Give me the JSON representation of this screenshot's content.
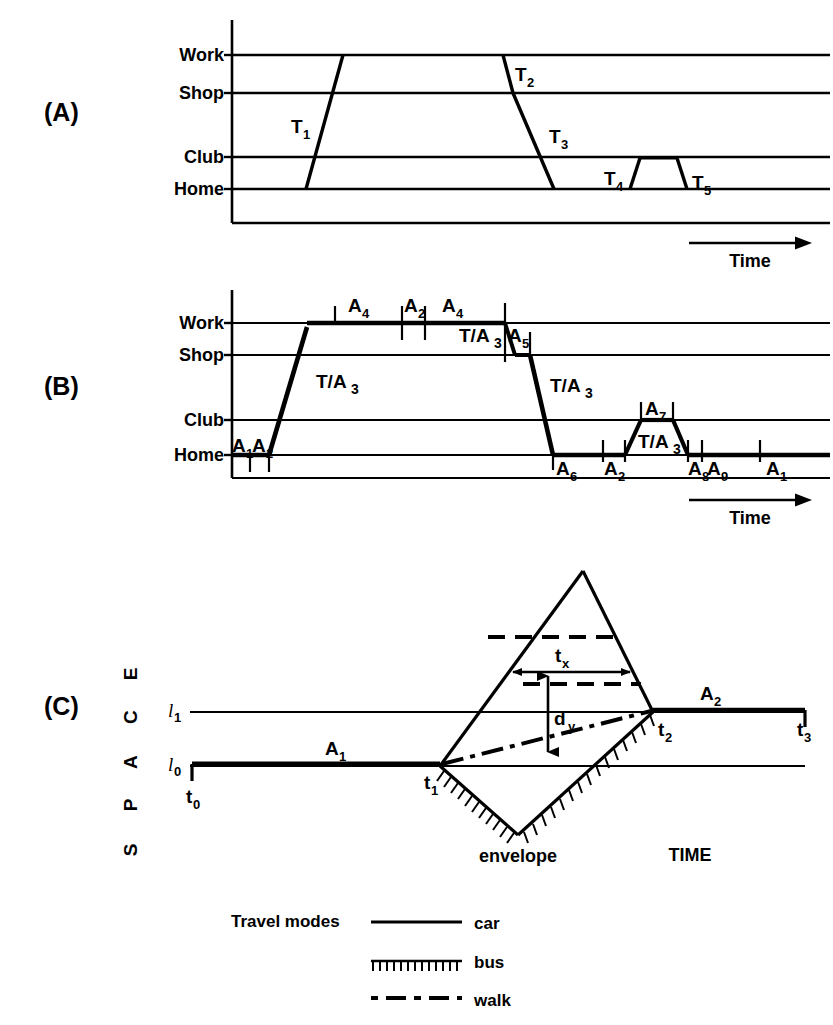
{
  "figure": {
    "panels": [
      {
        "id": "A",
        "label": "(A)"
      },
      {
        "id": "B",
        "label": "(B)"
      },
      {
        "id": "C",
        "label": "(C)"
      }
    ]
  },
  "panel_a": {
    "label": "(A)",
    "axis_labels": [
      "Work",
      "Shop",
      "Club",
      "Home"
    ],
    "time_axis_label": "Time",
    "trip_labels": [
      "T",
      "T",
      "T",
      "T",
      "T"
    ],
    "trips": [
      {
        "name": "T1",
        "base": "T",
        "sub": "1"
      },
      {
        "name": "T2",
        "base": "T",
        "sub": "2"
      },
      {
        "name": "T3",
        "base": "T",
        "sub": "3"
      },
      {
        "name": "T4",
        "base": "T",
        "sub": "4"
      },
      {
        "name": "T5",
        "base": "T",
        "sub": "5"
      }
    ]
  },
  "panel_b": {
    "label": "(B)",
    "axis_labels": [
      "Work",
      "Shop",
      "Club",
      "Home"
    ],
    "time_axis_label": "Time",
    "activities": [
      {
        "base": "A",
        "sub": "1"
      },
      {
        "base": "A",
        "sub": "2"
      },
      {
        "base": "A",
        "sub": "4"
      },
      {
        "base": "A",
        "sub": "2"
      },
      {
        "base": "A",
        "sub": "4"
      },
      {
        "base": "A",
        "sub": "5"
      },
      {
        "base": "A",
        "sub": "7"
      },
      {
        "base": "A",
        "sub": "6"
      },
      {
        "base": "A",
        "sub": "2"
      },
      {
        "base": "A",
        "sub": "8"
      },
      {
        "base": "A",
        "sub": "9"
      },
      {
        "base": "A",
        "sub": "1"
      }
    ],
    "travel_labels": [
      {
        "base": "T/A",
        "sub": "3"
      },
      {
        "base": "T/A",
        "sub": "3"
      },
      {
        "base": "T/A",
        "sub": "3"
      },
      {
        "base": "T/A",
        "sub": "3"
      }
    ]
  },
  "panel_c": {
    "label": "(C)",
    "y_axis_label": "SPACE",
    "y_axis_letters": [
      "S",
      "P",
      "A",
      "C",
      "E"
    ],
    "x_axis_label": "TIME",
    "space_ticks": [
      {
        "base": "l",
        "sub": "1"
      },
      {
        "base": "l",
        "sub": "0"
      }
    ],
    "time_ticks": [
      {
        "base": "t",
        "sub": "0"
      },
      {
        "base": "t",
        "sub": "1"
      },
      {
        "base": "t",
        "sub": "2"
      },
      {
        "base": "t",
        "sub": "3"
      }
    ],
    "activity_labels": [
      {
        "base": "A",
        "sub": "1"
      },
      {
        "base": "A",
        "sub": "2"
      }
    ],
    "measure_labels": [
      {
        "base": "t",
        "sub": "x"
      },
      {
        "base": "d",
        "sub": "y"
      }
    ],
    "envelope_label": "envelope"
  },
  "legend": {
    "title": "Travel modes",
    "entries": [
      {
        "label": "car",
        "style": "solid"
      },
      {
        "label": "bus",
        "style": "hatched"
      },
      {
        "label": "walk",
        "style": "dash-dot"
      }
    ]
  },
  "colors": {
    "ink": "#000000",
    "paper": "#ffffff"
  }
}
